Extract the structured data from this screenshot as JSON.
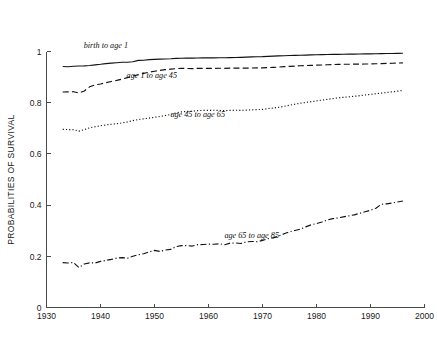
{
  "chart_data": {
    "type": "line",
    "title": "",
    "xlabel": "",
    "ylabel": "PROBABILITIES OF SURVIVAL",
    "xlim": [
      1930,
      2000
    ],
    "ylim": [
      0,
      1
    ],
    "xticks": [
      1930,
      1940,
      1950,
      1960,
      1970,
      1980,
      1990,
      2000
    ],
    "xticklabels": [
      "1930",
      "1940",
      "1950",
      "1960",
      "1970",
      "1980",
      "1990",
      "2000"
    ],
    "yticks": [
      0,
      0.2,
      0.4,
      0.6,
      0.8,
      1
    ],
    "yticklabels": [
      "0",
      "0.2",
      "0.4",
      "0.6",
      "0.8",
      "1"
    ],
    "grid": false,
    "legend": "inline annotations",
    "x": [
      1933,
      1934,
      1935,
      1936,
      1937,
      1938,
      1939,
      1940,
      1941,
      1942,
      1943,
      1944,
      1945,
      1946,
      1947,
      1948,
      1949,
      1950,
      1951,
      1952,
      1953,
      1954,
      1955,
      1956,
      1957,
      1958,
      1959,
      1960,
      1961,
      1962,
      1963,
      1964,
      1965,
      1966,
      1967,
      1968,
      1969,
      1970,
      1971,
      1972,
      1973,
      1974,
      1975,
      1976,
      1977,
      1978,
      1979,
      1980,
      1981,
      1982,
      1983,
      1984,
      1985,
      1986,
      1987,
      1988,
      1989,
      1990,
      1991,
      1992,
      1993,
      1994,
      1995,
      1996
    ],
    "series": [
      {
        "name": "birth to age 1",
        "label": "birth to age 1",
        "linestyle": "solid",
        "color": "#121212",
        "label_x": 1941.0,
        "label_y": 1.012,
        "values": [
          0.9415,
          0.9405,
          0.9425,
          0.9435,
          0.944,
          0.9455,
          0.948,
          0.95,
          0.9525,
          0.9545,
          0.956,
          0.958,
          0.958,
          0.96,
          0.9655,
          0.966,
          0.968,
          0.969,
          0.97,
          0.9705,
          0.9715,
          0.973,
          0.9735,
          0.974,
          0.974,
          0.9745,
          0.975,
          0.975,
          0.9752,
          0.9755,
          0.9755,
          0.976,
          0.9765,
          0.977,
          0.9778,
          0.9788,
          0.9795,
          0.98,
          0.981,
          0.982,
          0.9828,
          0.9836,
          0.9842,
          0.9848,
          0.9855,
          0.986,
          0.9866,
          0.9872,
          0.9878,
          0.9882,
          0.9886,
          0.989,
          0.9893,
          0.9896,
          0.9899,
          0.9902,
          0.9905,
          0.9908,
          0.9912,
          0.9916,
          0.992,
          0.9924,
          0.9928,
          0.9932
        ]
      },
      {
        "name": "age 1 to age 45",
        "label": "age 1 to age 45",
        "linestyle": "dashed",
        "color": "#121212",
        "label_x": 1949.5,
        "label_y": 0.898,
        "values": [
          0.842,
          0.8425,
          0.843,
          0.838,
          0.846,
          0.862,
          0.87,
          0.873,
          0.878,
          0.883,
          0.887,
          0.892,
          0.898,
          0.904,
          0.909,
          0.9145,
          0.919,
          0.923,
          0.9265,
          0.929,
          0.931,
          0.933,
          0.934,
          0.9338,
          0.9332,
          0.934,
          0.9342,
          0.9345,
          0.9343,
          0.9345,
          0.9342,
          0.9348,
          0.935,
          0.9348,
          0.9352,
          0.9355,
          0.9358,
          0.9362,
          0.9372,
          0.938,
          0.9392,
          0.9408,
          0.942,
          0.9432,
          0.9442,
          0.945,
          0.9458,
          0.9466,
          0.9474,
          0.9482,
          0.949,
          0.9496,
          0.95,
          0.9502,
          0.9505,
          0.9508,
          0.951,
          0.9514,
          0.952,
          0.9528,
          0.9534,
          0.954,
          0.9548,
          0.9556
        ]
      },
      {
        "name": "age 45 to age 65",
        "label": "age 45  to age 65",
        "linestyle": "dotted",
        "color": "#121212",
        "label_x": 1958.0,
        "label_y": 0.745,
        "values": [
          0.696,
          0.695,
          0.6945,
          0.689,
          0.695,
          0.702,
          0.706,
          0.71,
          0.713,
          0.716,
          0.718,
          0.721,
          0.725,
          0.73,
          0.734,
          0.737,
          0.74,
          0.743,
          0.746,
          0.75,
          0.754,
          0.76,
          0.764,
          0.766,
          0.767,
          0.769,
          0.77,
          0.77,
          0.7705,
          0.77,
          0.769,
          0.77,
          0.7705,
          0.77,
          0.771,
          0.772,
          0.773,
          0.774,
          0.777,
          0.779,
          0.782,
          0.786,
          0.79,
          0.794,
          0.798,
          0.801,
          0.804,
          0.807,
          0.81,
          0.813,
          0.816,
          0.819,
          0.821,
          0.823,
          0.825,
          0.8275,
          0.83,
          0.8325,
          0.835,
          0.8375,
          0.84,
          0.8425,
          0.845,
          0.848
        ]
      },
      {
        "name": "age 65 to age 85",
        "label": "age 65  to age 85",
        "linestyle": "dashdot",
        "color": "#121212",
        "label_x": 1968.0,
        "label_y": 0.272,
        "values": [
          0.1755,
          0.174,
          0.1755,
          0.156,
          0.17,
          0.1745,
          0.174,
          0.18,
          0.184,
          0.188,
          0.193,
          0.195,
          0.1925,
          0.2,
          0.206,
          0.21,
          0.217,
          0.223,
          0.219,
          0.2245,
          0.227,
          0.238,
          0.2415,
          0.242,
          0.24,
          0.2455,
          0.246,
          0.2475,
          0.247,
          0.249,
          0.245,
          0.2515,
          0.252,
          0.25,
          0.2565,
          0.258,
          0.257,
          0.262,
          0.269,
          0.272,
          0.279,
          0.288,
          0.296,
          0.301,
          0.306,
          0.315,
          0.323,
          0.328,
          0.334,
          0.342,
          0.347,
          0.35,
          0.354,
          0.358,
          0.362,
          0.368,
          0.374,
          0.38,
          0.388,
          0.403,
          0.405,
          0.408,
          0.412,
          0.416
        ]
      }
    ]
  }
}
